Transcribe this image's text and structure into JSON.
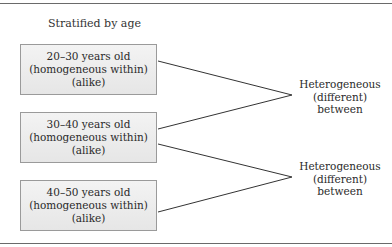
{
  "diagram": {
    "title": "Stratified by age",
    "strata": [
      {
        "range": "20–30 years old",
        "within": "(homogeneous within)",
        "note": "(alike)"
      },
      {
        "range": "30–40 years old",
        "within": "(homogeneous within)",
        "note": "(alike)"
      },
      {
        "range": "40–50 years old",
        "within": "(homogeneous within)",
        "note": "(alike)"
      }
    ],
    "comparisons": [
      {
        "line1": "Heterogeneous",
        "line2": "(different)",
        "line3": "between",
        "connects": [
          0,
          1
        ]
      },
      {
        "line1": "Heterogeneous",
        "line2": "(different)",
        "line3": "between",
        "connects": [
          1,
          2
        ]
      }
    ]
  }
}
